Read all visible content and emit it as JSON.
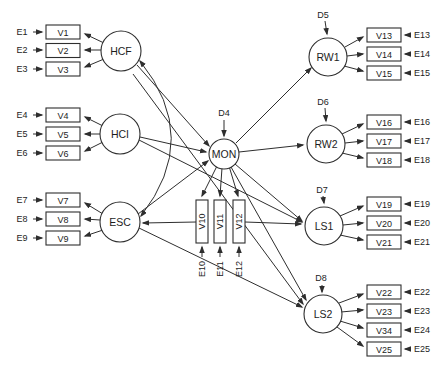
{
  "figure": {
    "background": "#ffffff",
    "line_color": "#2e2e2e",
    "exogenous_factors": [
      {
        "label": "HCF",
        "indicators": [
          "V1",
          "V2",
          "V3"
        ],
        "errors": [
          "E1",
          "E2",
          "E3"
        ]
      },
      {
        "label": "HCI",
        "indicators": [
          "V4",
          "V5",
          "V6"
        ],
        "errors": [
          "E4",
          "E5",
          "E6"
        ]
      },
      {
        "label": "ESC",
        "indicators": [
          "V7",
          "V8",
          "V9"
        ],
        "errors": [
          "E7",
          "E8",
          "E9"
        ]
      }
    ],
    "mediator": {
      "label": "MON",
      "disturbance": "D4",
      "indicators": [
        "V10",
        "V11",
        "V12"
      ],
      "errors": [
        "E10",
        "E11",
        "E12"
      ]
    },
    "endogenous_factors": [
      {
        "label": "RW1",
        "disturbance": "D5",
        "indicators": [
          "V13",
          "V14",
          "V15"
        ],
        "errors": [
          "E13",
          "E14",
          "E15"
        ]
      },
      {
        "label": "RW2",
        "disturbance": "D6",
        "indicators": [
          "V16",
          "V17",
          "V18"
        ],
        "errors": [
          "E16",
          "E17",
          "E18"
        ]
      },
      {
        "label": "LS1",
        "disturbance": "D7",
        "indicators": [
          "V19",
          "V20",
          "V21"
        ],
        "errors": [
          "E19",
          "E20",
          "E21"
        ]
      },
      {
        "label": "LS2",
        "disturbance": "D8",
        "indicators": [
          "V22",
          "V23",
          "V34",
          "V25"
        ],
        "errors": [
          "E22",
          "E23",
          "E24",
          "E25"
        ]
      }
    ]
  }
}
